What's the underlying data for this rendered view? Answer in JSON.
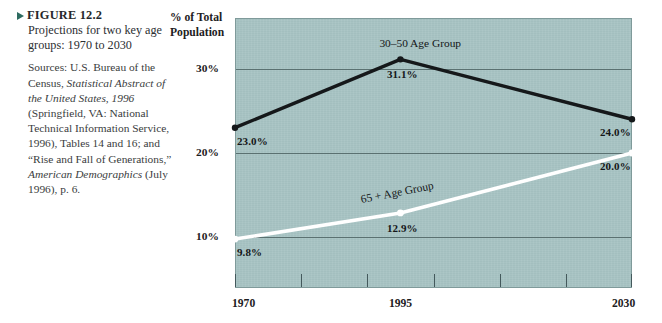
{
  "figure": {
    "marker_icon": "triangle-right-icon",
    "label": "FIGURE 12.2",
    "title": "Projections for two key age groups: 1970 to 2030",
    "sources_prefix": "Sources: U.S. Bureau of the Census, ",
    "sources_italic_1": "Statistical Abstract of the United States, 1996",
    "sources_mid": " (Springfield, VA: National Technical Information Service, 1996), Tables 14 and 16; and “Rise and Fall of Generations,” ",
    "sources_italic_2": "American Demographics",
    "sources_tail": " (July 1996), p. 6."
  },
  "chart_data": {
    "type": "line",
    "title": "",
    "ylabel": "% of Total Population",
    "xlabel": "",
    "x": [
      1970,
      1995,
      2030
    ],
    "xtick_labels": [
      "1970",
      "1995",
      "2030"
    ],
    "ytick_labels": [
      "30%",
      "20%",
      "10%"
    ],
    "yticks": [
      30,
      20,
      10
    ],
    "ylim": [
      4.0,
      36.0
    ],
    "xlim": [
      1970,
      2030
    ],
    "grid": true,
    "legend": "inline-labels",
    "plot_bg": "#a7c3c3",
    "series": [
      {
        "name": "30–50 Age Group",
        "color": "#15181a",
        "values": [
          23.0,
          31.1,
          24.0
        ],
        "point_labels": [
          "23.0%",
          "31.1%",
          "24.0%"
        ]
      },
      {
        "name": "65 + Age Group",
        "color": "#ffffff",
        "values": [
          9.8,
          12.9,
          20.0
        ],
        "point_labels": [
          "9.8%",
          "12.9%",
          "20.0%"
        ]
      }
    ]
  }
}
